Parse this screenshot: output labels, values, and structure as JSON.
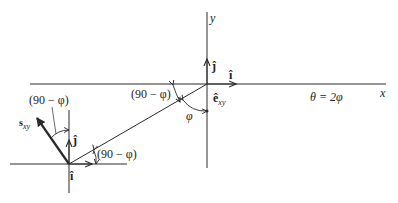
{
  "diagram": {
    "axes": {
      "x_label": "x",
      "y_label": "y"
    },
    "unit_vectors_origin": {
      "i_label": "î",
      "j_label": "ĵ",
      "e_label": "ê",
      "e_subscript": "xy"
    },
    "unit_vectors_lower": {
      "i_label": "î",
      "j_label": "ĵ",
      "s_label": "s",
      "s_subscript": "xy"
    },
    "angles": {
      "upper_left": "(90 − φ)",
      "upper_mid": "(90 − φ)",
      "lower_right": "(90 − φ)",
      "phi": "φ"
    },
    "relation": "θ = 2φ",
    "colors": {
      "line": "#2a2a2a",
      "background": "#ffffff"
    }
  }
}
